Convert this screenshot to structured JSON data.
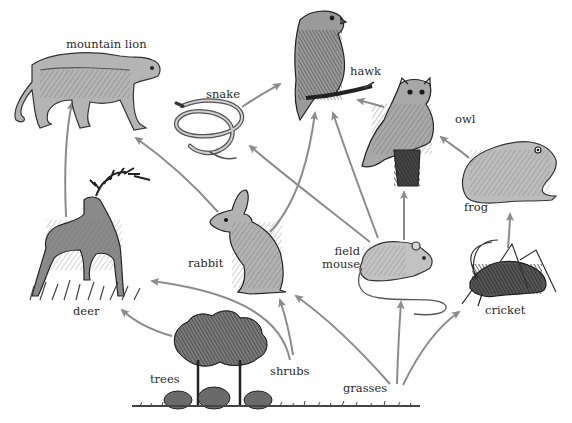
{
  "diagram": {
    "type": "food-web",
    "arrow_color": "#8c8c8c",
    "ink_color": "#3a3a3a",
    "nodes": [
      {
        "id": "mountain_lion",
        "label": "mountain lion"
      },
      {
        "id": "hawk",
        "label": "hawk"
      },
      {
        "id": "snake",
        "label": "snake"
      },
      {
        "id": "owl",
        "label": "owl"
      },
      {
        "id": "frog",
        "label": "frog"
      },
      {
        "id": "deer",
        "label": "deer"
      },
      {
        "id": "rabbit",
        "label": "rabbit"
      },
      {
        "id": "field_mouse",
        "label_line1": "field",
        "label_line2": "mouse"
      },
      {
        "id": "cricket",
        "label": "cricket"
      },
      {
        "id": "trees",
        "label": "trees"
      },
      {
        "id": "shrubs",
        "label": "shrubs"
      },
      {
        "id": "grasses",
        "label": "grasses"
      }
    ],
    "edges": [
      {
        "from": "deer",
        "to": "mountain lion"
      },
      {
        "from": "rabbit",
        "to": "mountain lion"
      },
      {
        "from": "rabbit",
        "to": "hawk"
      },
      {
        "from": "snake",
        "to": "hawk"
      },
      {
        "from": "field mouse",
        "to": "snake"
      },
      {
        "from": "field mouse",
        "to": "hawk"
      },
      {
        "from": "field mouse",
        "to": "owl"
      },
      {
        "from": "owl",
        "to": "hawk"
      },
      {
        "from": "frog",
        "to": "owl"
      },
      {
        "from": "cricket",
        "to": "frog"
      },
      {
        "from": "trees",
        "to": "deer"
      },
      {
        "from": "shrubs",
        "to": "deer"
      },
      {
        "from": "shrubs",
        "to": "rabbit"
      },
      {
        "from": "grasses",
        "to": "rabbit"
      },
      {
        "from": "grasses",
        "to": "field mouse"
      },
      {
        "from": "grasses",
        "to": "cricket"
      }
    ]
  }
}
